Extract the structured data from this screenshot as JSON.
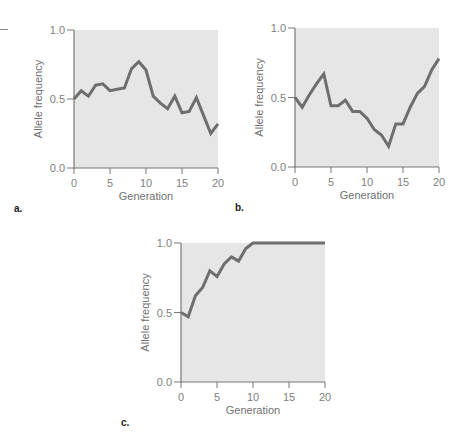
{
  "colors": {
    "plot_background": "#e6e6e6",
    "line": "#6e6e6e",
    "axis": "#777777",
    "text": "#808080"
  },
  "chart_data": [
    {
      "type": "line",
      "panel_label": "a.",
      "title": "",
      "xlabel": "Generation",
      "ylabel": "Allele frequency",
      "xlim": [
        0,
        20
      ],
      "ylim": [
        0.0,
        1.0
      ],
      "xticks": [
        "0",
        "5",
        "10",
        "15",
        "20"
      ],
      "yticks": [
        "0.0",
        "0.5",
        "1.0"
      ],
      "grid": false,
      "legend": null,
      "x": [
        0,
        1,
        2,
        3,
        4,
        5,
        6,
        7,
        8,
        9,
        10,
        11,
        12,
        13,
        14,
        15,
        16,
        17,
        18,
        19,
        20
      ],
      "values": [
        0.5,
        0.56,
        0.52,
        0.6,
        0.61,
        0.56,
        0.57,
        0.58,
        0.72,
        0.77,
        0.71,
        0.52,
        0.47,
        0.43,
        0.52,
        0.4,
        0.41,
        0.51,
        0.38,
        0.25,
        0.32
      ]
    },
    {
      "type": "line",
      "panel_label": "b.",
      "title": "",
      "xlabel": "Generation",
      "ylabel": "Allele frequency",
      "xlim": [
        0,
        20
      ],
      "ylim": [
        0.0,
        1.0
      ],
      "xticks": [
        "0",
        "5",
        "10",
        "15",
        "20"
      ],
      "yticks": [
        "0.0",
        "0.5",
        "1.0"
      ],
      "grid": false,
      "legend": null,
      "x": [
        0,
        1,
        2,
        3,
        4,
        5,
        6,
        7,
        8,
        9,
        10,
        11,
        12,
        13,
        14,
        15,
        16,
        17,
        18,
        19,
        20
      ],
      "values": [
        0.5,
        0.43,
        0.52,
        0.6,
        0.67,
        0.44,
        0.44,
        0.48,
        0.4,
        0.4,
        0.35,
        0.27,
        0.23,
        0.15,
        0.31,
        0.31,
        0.43,
        0.53,
        0.58,
        0.7,
        0.78
      ]
    },
    {
      "type": "line",
      "panel_label": "c.",
      "title": "",
      "xlabel": "Generation",
      "ylabel": "Allele frequency",
      "xlim": [
        0,
        20
      ],
      "ylim": [
        0.0,
        1.0
      ],
      "xticks": [
        "0",
        "5",
        "10",
        "15",
        "20"
      ],
      "yticks": [
        "0.0",
        "0.5",
        "1.0"
      ],
      "grid": false,
      "legend": null,
      "x": [
        0,
        1,
        2,
        3,
        4,
        5,
        6,
        7,
        8,
        9,
        10,
        11,
        12,
        13,
        14,
        15,
        16,
        17,
        18,
        19,
        20
      ],
      "values": [
        0.5,
        0.47,
        0.62,
        0.68,
        0.8,
        0.76,
        0.85,
        0.9,
        0.87,
        0.96,
        1.0,
        1.0,
        1.0,
        1.0,
        1.0,
        1.0,
        1.0,
        1.0,
        1.0,
        1.0,
        1.0
      ]
    }
  ]
}
